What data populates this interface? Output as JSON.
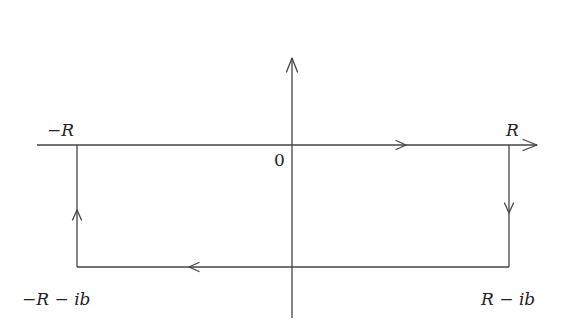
{
  "diagram": {
    "type": "contour-diagram",
    "colors": {
      "line": "#444444",
      "text": "#222222",
      "background": "#ffffff"
    },
    "axes": {
      "horizontal": {
        "arrow": "right"
      },
      "vertical": {
        "arrow": "up"
      },
      "origin_label": "0"
    },
    "vertices": [
      {
        "id": "top-left",
        "label_sign": "−",
        "label_var": "R",
        "label": "−R"
      },
      {
        "id": "top-right",
        "label_var": "R",
        "label": "R"
      },
      {
        "id": "bottom-right",
        "label": "R − ib",
        "part1": "R",
        "op": " − ",
        "part2": "ib"
      },
      {
        "id": "bottom-left",
        "label": "−R − ib",
        "sign": "−",
        "part1": "R",
        "op": " − ",
        "part2": "ib"
      }
    ],
    "edges": [
      {
        "from": "top-left",
        "to": "top-right",
        "direction": "right"
      },
      {
        "from": "top-right",
        "to": "bottom-right",
        "direction": "down"
      },
      {
        "from": "bottom-right",
        "to": "bottom-left",
        "direction": "left"
      },
      {
        "from": "bottom-left",
        "to": "top-left",
        "direction": "up"
      }
    ]
  }
}
